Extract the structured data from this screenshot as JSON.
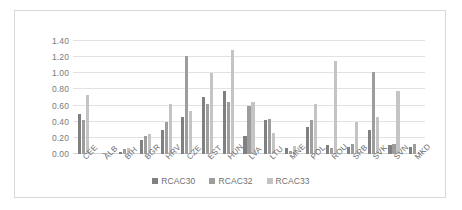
{
  "chart_data": {
    "type": "bar",
    "title": "",
    "subtitle": "",
    "xlabel": "",
    "ylabel": "",
    "ylim": [
      0.0,
      1.4
    ],
    "ytick_labels": [
      "0.00",
      "0.20",
      "0.40",
      "0.60",
      "0.80",
      "1.00",
      "1.20",
      "1.40"
    ],
    "ytick_values": [
      0.0,
      0.2,
      0.4,
      0.6,
      0.8,
      1.0,
      1.2,
      1.4
    ],
    "grid": true,
    "legend_position": "bottom",
    "categories": [
      "CEE",
      "ALB",
      "BIH",
      "BGR",
      "HRV",
      "CZE",
      "EST",
      "HUN",
      "LVA",
      "LTU",
      "MNE",
      "POL",
      "ROU",
      "SRB",
      "SVK",
      "SVN",
      "MKD"
    ],
    "series": [
      {
        "name": "RCAC30",
        "color": "#808080",
        "values": [
          0.5,
          0.0,
          0.03,
          0.17,
          0.3,
          0.46,
          0.71,
          0.78,
          0.22,
          0.42,
          0.08,
          0.33,
          0.11,
          0.09,
          0.3,
          0.11,
          0.09
        ]
      },
      {
        "name": "RCAC32",
        "color": "#9d9d9d",
        "values": [
          0.42,
          0.01,
          0.06,
          0.22,
          0.4,
          1.22,
          0.62,
          0.64,
          0.6,
          0.43,
          0.04,
          0.42,
          0.07,
          0.12,
          1.02,
          0.13,
          0.13
        ]
      },
      {
        "name": "RCAC33",
        "color": "#c4c4c4",
        "values": [
          0.73,
          0.01,
          0.08,
          0.25,
          0.62,
          0.53,
          1.0,
          1.29,
          0.64,
          0.26,
          0.1,
          0.62,
          1.15,
          0.4,
          0.46,
          0.78,
          0.0
        ]
      }
    ]
  },
  "legend": {
    "items": [
      {
        "label": "RCAC30",
        "color": "#808080"
      },
      {
        "label": "RCAC32",
        "color": "#9d9d9d"
      },
      {
        "label": "RCAC33",
        "color": "#c4c4c4"
      }
    ]
  }
}
